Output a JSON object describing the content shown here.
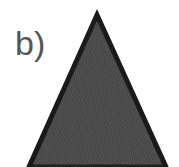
{
  "panel": {
    "label": "b)",
    "label_color": "#555555",
    "background_color": "#ffffff"
  },
  "shape": {
    "name": "triangle",
    "fill_color": "#4a4a4a",
    "outline_color": "#1a1a1a",
    "outline_width_px": 5,
    "texture": "granular-noise",
    "apex_x": 97,
    "apex_y": 15,
    "base_left_x": 29,
    "base_right_x": 166,
    "base_y": 167
  }
}
